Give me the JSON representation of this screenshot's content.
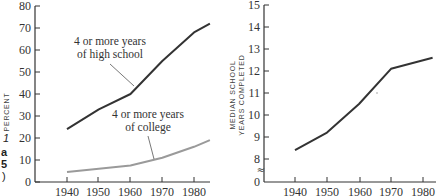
{
  "chart_data": [
    {
      "type": "line",
      "title": "",
      "xlabel": "",
      "ylabel": "PERCENT",
      "ylim": [
        0,
        80
      ],
      "yticks": [
        0,
        10,
        20,
        30,
        40,
        50,
        60,
        70,
        80
      ],
      "xticks": [
        1940,
        1950,
        1960,
        1970,
        1980
      ],
      "xlim": [
        1930,
        1985
      ],
      "grid": false,
      "legend_position": "inline annotations",
      "x": [
        1940,
        1950,
        1960,
        1970,
        1980,
        1985
      ],
      "series": [
        {
          "name": "4 or more years of high school",
          "color": "#333333",
          "values": [
            24,
            33,
            40,
            55,
            68,
            72
          ]
        },
        {
          "name": "4 or more years of college",
          "color": "#9a9a9a",
          "values": [
            4.5,
            6,
            7.5,
            11,
            16,
            19
          ]
        }
      ],
      "annotations": [
        {
          "line1": "4 or more years",
          "line2": "of high school"
        },
        {
          "line1": "4 or more years",
          "line2": "of college"
        }
      ]
    },
    {
      "type": "line",
      "title": "",
      "xlabel": "",
      "ylabel": "MEDIAN SCHOOL YEARS COMPLETED",
      "ylabel_lines": [
        "MEDIAN SCHOOL",
        "YEARS COMPLETED"
      ],
      "ylim": [
        0,
        15
      ],
      "axis_break": "between 0 and 8",
      "yticks": [
        0,
        8,
        9,
        10,
        11,
        12,
        13,
        14,
        15
      ],
      "xticks": [
        1940,
        1950,
        1960,
        1970,
        1980
      ],
      "xlim": [
        1930,
        1983
      ],
      "grid": false,
      "x": [
        1940,
        1950,
        1960,
        1970,
        1983
      ],
      "series": [
        {
          "name": "Median school years completed",
          "color": "#333333",
          "values": [
            8.4,
            9.2,
            10.5,
            12.1,
            12.6
          ]
        }
      ]
    }
  ],
  "left_chart": {
    "y_axis_title": "PERCENT",
    "y_ticks": [
      "0",
      "10",
      "20",
      "30",
      "40",
      "50",
      "60",
      "70",
      "80"
    ],
    "x_ticks": [
      "1940",
      "1950",
      "1960",
      "1970",
      "1980"
    ],
    "annotation_hs": [
      "4 or more years",
      "of high school"
    ],
    "annotation_college": [
      "4 or more years",
      "of college"
    ]
  },
  "right_chart": {
    "y_axis_title": [
      "MEDIAN SCHOOL",
      "YEARS COMPLETED"
    ],
    "y_ticks": [
      "0",
      "8",
      "9",
      "10",
      "11",
      "12",
      "13",
      "14",
      "15"
    ],
    "x_ticks": [
      "1940",
      "1950",
      "1960",
      "1970",
      "1980"
    ],
    "break_symbol": "≈"
  },
  "left_edge_fragments": [
    "1",
    "a",
    "5",
    ")"
  ]
}
